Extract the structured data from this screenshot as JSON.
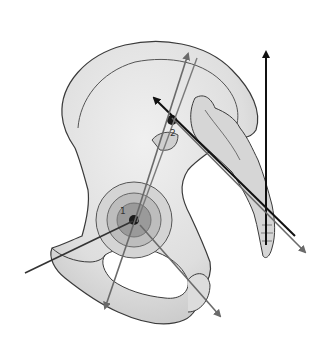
{
  "figure": {
    "labels": [
      {
        "id": "1",
        "text": "1",
        "x": 120,
        "y": 212
      },
      {
        "id": "2",
        "text": "2",
        "x": 170,
        "y": 133
      }
    ],
    "colors": {
      "bone_fill": "#e6e6e6",
      "bone_shade": "#c9c9c9",
      "outline": "#3a3a3a",
      "acetabulum_outer": "#bdbdbd",
      "acetabulum_inner": "#8e8e8e",
      "arrow_dark": "#111111",
      "arrow_gray": "#6a6a6a"
    },
    "vectors": [
      {
        "name": "vertical-arrow",
        "x1": 266,
        "y1": 245,
        "x2": 266,
        "y2": 50,
        "color": "#111111"
      },
      {
        "name": "si-black-arrow",
        "x1": 295,
        "y1": 236,
        "x2": 152,
        "y2": 96,
        "color": "#111111"
      },
      {
        "name": "si-gray-arrow",
        "x1": 172,
        "y1": 118,
        "x2": 307,
        "y2": 254,
        "color": "#6a6a6a"
      },
      {
        "name": "long-gray-arrow-1",
        "x1": 105,
        "y1": 310,
        "x2": 188,
        "y2": 52,
        "color": "#6a6a6a"
      },
      {
        "name": "long-gray-arrow-2",
        "x1": 137,
        "y1": 221,
        "x2": 198,
        "y2": 56,
        "color": "#6a6a6a"
      },
      {
        "name": "hip-left-line",
        "x1": 25,
        "y1": 273,
        "x2": 133,
        "y2": 221,
        "color": "#333333"
      },
      {
        "name": "hip-down-gray-arrow",
        "x1": 140,
        "y1": 225,
        "x2": 220,
        "y2": 318,
        "color": "#6a6a6a"
      }
    ]
  }
}
